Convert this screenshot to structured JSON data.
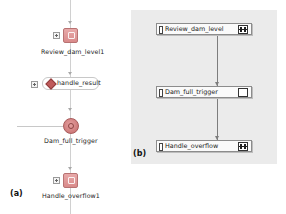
{
  "panel_a": {
    "letter": "(a)",
    "nodes": [
      {
        "id": "review",
        "type": "task",
        "label": "Review_dam_level1"
      },
      {
        "id": "handle_result",
        "type": "gateway",
        "label": "handle_result"
      },
      {
        "id": "dam_trigger",
        "type": "event",
        "label": "Dam_full_trigger"
      },
      {
        "id": "handle_overflow",
        "type": "task",
        "label": "Handle_overflow1"
      }
    ]
  },
  "panel_b": {
    "letter": "(b)",
    "nodes": [
      {
        "label": "Review_dam_level",
        "icon": "split-icon"
      },
      {
        "label": "Dam_full_trigger",
        "icon": "checker-icon"
      },
      {
        "label": "Handle_overflow",
        "icon": "split-icon"
      }
    ]
  }
}
